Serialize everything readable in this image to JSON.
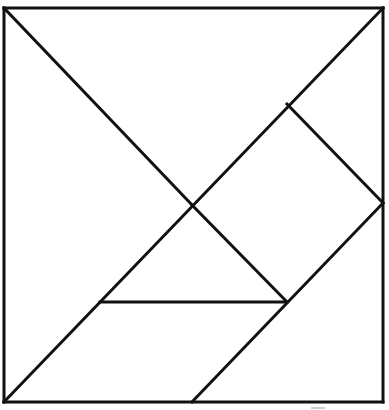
{
  "diagram": {
    "stroke_color": "#111111",
    "background_color": "#ffffff",
    "outer_square": {
      "x1": 4,
      "y1": 8,
      "x2": 383,
      "y2": 402
    },
    "pieces": [
      {
        "id": "large-triangle-left",
        "type": "large triangle",
        "points": [
          [
            4,
            8
          ],
          [
            192,
            205
          ],
          [
            4,
            402
          ]
        ]
      },
      {
        "id": "large-triangle-top",
        "type": "large triangle",
        "points": [
          [
            4,
            8
          ],
          [
            383,
            8
          ],
          [
            192,
            205
          ]
        ]
      },
      {
        "id": "square",
        "type": "square",
        "points": [
          [
            287,
            104
          ],
          [
            383,
            203
          ],
          [
            287,
            302
          ],
          [
            192,
            205
          ]
        ]
      },
      {
        "id": "small-triangle-right",
        "type": "small triangle",
        "points": [
          [
            287,
            104
          ],
          [
            383,
            8
          ],
          [
            383,
            203
          ]
        ]
      },
      {
        "id": "small-triangle-middle",
        "type": "small triangle",
        "points": [
          [
            192,
            205
          ],
          [
            287,
            302
          ],
          [
            100,
            302
          ]
        ]
      },
      {
        "id": "parallelogram",
        "type": "parallelogram",
        "points": [
          [
            100,
            302
          ],
          [
            287,
            302
          ],
          [
            192,
            402
          ],
          [
            4,
            402
          ]
        ]
      },
      {
        "id": "medium-triangle",
        "type": "medium triangle",
        "points": [
          [
            383,
            203
          ],
          [
            383,
            402
          ],
          [
            192,
            402
          ]
        ]
      }
    ],
    "edges": [
      {
        "id": "frame-top",
        "x1": 4,
        "y1": 8,
        "x2": 383,
        "y2": 8
      },
      {
        "id": "frame-right",
        "x1": 383,
        "y1": 8,
        "x2": 383,
        "y2": 402
      },
      {
        "id": "frame-bottom",
        "x1": 4,
        "y1": 402,
        "x2": 383,
        "y2": 402
      },
      {
        "id": "frame-left",
        "x1": 4,
        "y1": 8,
        "x2": 4,
        "y2": 402
      },
      {
        "id": "diag-tl-center",
        "x1": 4,
        "y1": 8,
        "x2": 192,
        "y2": 205
      },
      {
        "id": "diag-tr-bl",
        "x1": 383,
        "y1": 8,
        "x2": 4,
        "y2": 402
      },
      {
        "id": "square-top-right",
        "x1": 287,
        "y1": 104,
        "x2": 383,
        "y2": 203
      },
      {
        "id": "center-to-mid",
        "x1": 192,
        "y1": 205,
        "x2": 287,
        "y2": 302
      },
      {
        "id": "mid-horizontal",
        "x1": 100,
        "y1": 302,
        "x2": 287,
        "y2": 302
      },
      {
        "id": "right-mid-diag",
        "x1": 383,
        "y1": 203,
        "x2": 192,
        "y2": 402
      }
    ]
  }
}
